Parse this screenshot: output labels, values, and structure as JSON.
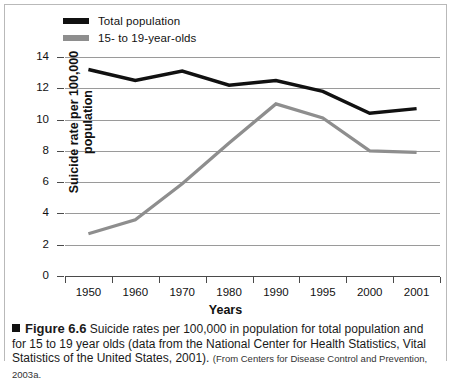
{
  "chart_data": {
    "type": "line",
    "title": "",
    "xlabel": "Years",
    "ylabel": "Suicide rate per 100,000 population",
    "categories": [
      "1950",
      "1960",
      "1970",
      "1980",
      "1990",
      "1995",
      "2000",
      "2001"
    ],
    "ylim": [
      0,
      14
    ],
    "ytick_labels": [
      "0",
      "2",
      "4",
      "6",
      "8",
      "10",
      "12",
      "14"
    ],
    "ytick_values": [
      0,
      2,
      4,
      6,
      8,
      10,
      12,
      14
    ],
    "grid": "horizontal",
    "legend_position": "top-left",
    "series": [
      {
        "name": "Total population",
        "color": "#111111",
        "values": [
          13.2,
          12.5,
          13.1,
          12.2,
          12.5,
          11.8,
          10.4,
          10.7
        ]
      },
      {
        "name": "15- to 19-year-olds",
        "color": "#8e8e8e",
        "values": [
          2.7,
          3.6,
          5.9,
          8.5,
          11.0,
          10.1,
          8.0,
          7.9
        ]
      }
    ]
  },
  "legend": {
    "items": [
      {
        "label": "Total population",
        "swatch": "total"
      },
      {
        "label": "15- to 19-year-olds",
        "swatch": "teen"
      }
    ]
  },
  "axes": {
    "y_title": "Suicide rate per 100,000 population",
    "x_title": "Years"
  },
  "caption": {
    "figure_number": "Figure 6.6",
    "text": "Suicide rates per 100,000 in population for total population and for 15 to 19 year olds (data from the National Center for Health Statistics, Vital Statistics of the United States, 2001).",
    "source": "(From Centers for Disease Control and Prevention, 2003a."
  }
}
